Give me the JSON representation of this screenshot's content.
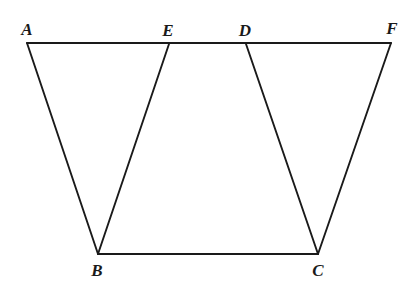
{
  "figure": {
    "background_color": "#ffffff",
    "stroke_color": "#1a1a1a",
    "width": 404,
    "height": 289,
    "points": {
      "A": {
        "label": "A",
        "x": 27,
        "y": 43,
        "label_x": 27,
        "label_y": 29
      },
      "E": {
        "label": "E",
        "x": 169,
        "y": 44,
        "label_x": 168,
        "label_y": 30
      },
      "D": {
        "label": "D",
        "x": 246,
        "y": 44,
        "label_x": 245,
        "label_y": 30
      },
      "F": {
        "label": "F",
        "x": 391,
        "y": 43,
        "label_x": 392,
        "label_y": 28
      },
      "B": {
        "label": "B",
        "x": 98,
        "y": 254,
        "label_x": 97,
        "label_y": 270
      },
      "C": {
        "label": "C",
        "x": 318,
        "y": 254,
        "label_x": 318,
        "label_y": 270
      }
    },
    "segments": [
      {
        "name": "segment-AF",
        "from": "A",
        "to": "F"
      },
      {
        "name": "segment-BC",
        "from": "B",
        "to": "C"
      },
      {
        "name": "segment-AB",
        "from": "A",
        "to": "B"
      },
      {
        "name": "segment-EB",
        "from": "E",
        "to": "B"
      },
      {
        "name": "segment-DC",
        "from": "D",
        "to": "C"
      },
      {
        "name": "segment-FC",
        "from": "F",
        "to": "C"
      }
    ]
  }
}
